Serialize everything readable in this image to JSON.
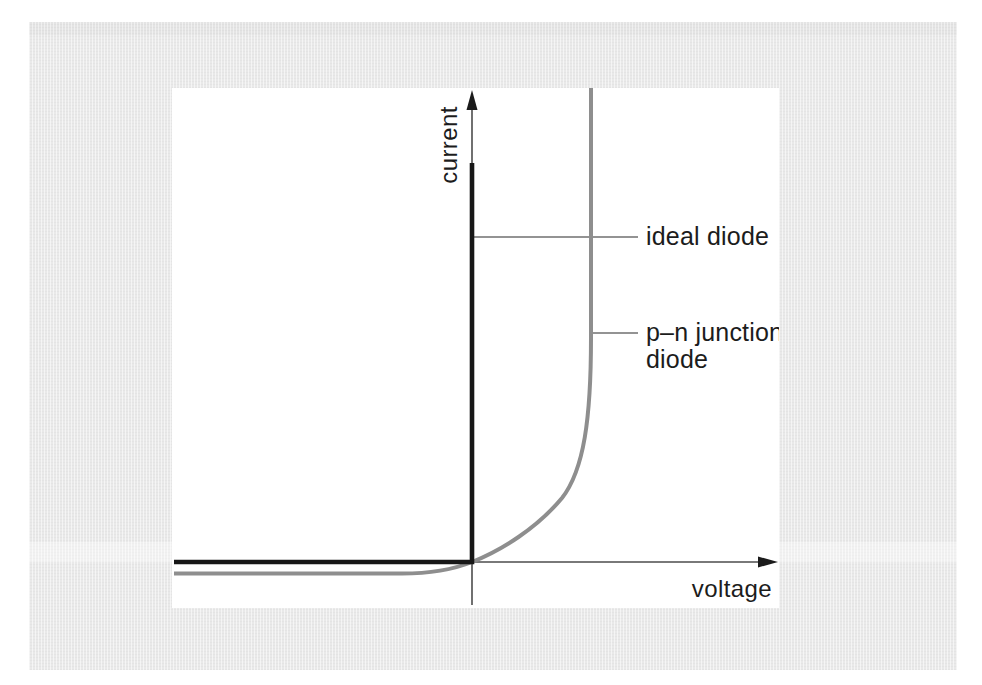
{
  "labels": {
    "y_axis": "current",
    "x_axis": "voltage",
    "ideal_diode": "ideal diode",
    "pn_line1": "p–n junction",
    "pn_line2": "diode"
  },
  "colors": {
    "page_background": "#ffffff",
    "plate_background": "#e9e9e9",
    "chart_background": "#ffffff",
    "ideal_curve": "#171717",
    "pn_curve": "#8e8e8e",
    "axis": "#4d4d4d",
    "pointer_line": "#6f6f6f",
    "text": "#1c1c1c"
  },
  "chart_data": {
    "type": "line",
    "title": "",
    "xlabel": "voltage",
    "ylabel": "current",
    "grid": false,
    "ticks": "none (qualitative sketch, no numeric scale)",
    "x_axis": {
      "arrow": true,
      "range_norm": [
        -1,
        1
      ]
    },
    "y_axis": {
      "arrow": true,
      "range_norm": [
        -0.05,
        1
      ]
    },
    "legend": "inline callout labels with leader lines",
    "series": [
      {
        "name": "ideal diode",
        "color": "#171717",
        "style": "thick solid",
        "points_norm": [
          [
            -1,
            0
          ],
          [
            0,
            0
          ],
          [
            0,
            0.84
          ]
        ],
        "description": "zero current for all negative voltage, then vertical line (infinite conduction) at zero voltage"
      },
      {
        "name": "p–n junction diode",
        "color": "#8e8e8e",
        "style": "thick solid",
        "points_norm": [
          [
            -1,
            -0.024
          ],
          [
            -0.4,
            -0.024
          ],
          [
            -0.2,
            -0.02
          ],
          [
            0,
            0
          ],
          [
            0.1,
            0.03
          ],
          [
            0.2,
            0.09
          ],
          [
            0.3,
            0.19
          ],
          [
            0.35,
            0.33
          ],
          [
            0.39,
            0.6
          ],
          [
            0.4,
            1.0
          ]
        ],
        "description": "small constant reverse saturation current below the axis for negative voltage, exponential turn-on rising to near-vertical at the threshold voltage"
      }
    ],
    "annotations": [
      {
        "text": "ideal diode",
        "leader_line": "horizontal from black vertical curve to label"
      },
      {
        "text": "p–n junction diode",
        "leader_line": "horizontal from gray vertical curve to label, label wraps to two lines"
      }
    ]
  },
  "svg_paths": {
    "x_axis": "M 300 474 H 590",
    "x_arrow": "M 606 474 L 586 468.5 L 586 479.5 Z",
    "y_axis": "M 300 517 V 12",
    "y_arrow": "M 300 2 L 294.5 22 L 305.5 22 Z",
    "pointer_ideal": "M 302 149 H 466",
    "pointer_pn": "M 421 245 H 466",
    "ideal_curve": "M 2 474 H 300 V 75",
    "pn_curve": "M 2 485.5 H 230 C 265 485.5 285 480 300 474 C 330 462 365 440 390 410 C 412 382 419 330 419 250 V 0"
  }
}
